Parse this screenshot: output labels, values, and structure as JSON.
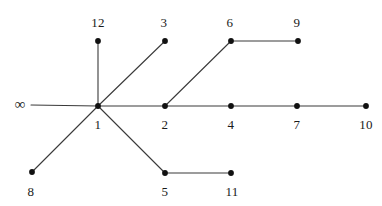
{
  "figure": {
    "type": "graph-diagram",
    "background_color": "#ffffff",
    "edge_color": "#3a3a3a",
    "node_color": "#111111",
    "label_color": "#1a1a1a",
    "width": 382,
    "height": 206
  },
  "infinity": {
    "symbol": "∞",
    "x": 20,
    "y": 104
  },
  "nodes": [
    {
      "id": "1",
      "label": "1",
      "x": 98,
      "y": 106,
      "label_x": 98,
      "label_y": 124
    },
    {
      "id": "2",
      "label": "2",
      "x": 165,
      "y": 106,
      "label_x": 165,
      "label_y": 124
    },
    {
      "id": "3",
      "label": "3",
      "x": 165,
      "y": 41,
      "label_x": 164,
      "label_y": 22
    },
    {
      "id": "4",
      "label": "4",
      "x": 231,
      "y": 106,
      "label_x": 231,
      "label_y": 124
    },
    {
      "id": "5",
      "label": "5",
      "x": 165,
      "y": 173,
      "label_x": 165,
      "label_y": 191
    },
    {
      "id": "6",
      "label": "6",
      "x": 231,
      "y": 41,
      "label_x": 230,
      "label_y": 22
    },
    {
      "id": "7",
      "label": "7",
      "x": 297,
      "y": 106,
      "label_x": 297,
      "label_y": 124
    },
    {
      "id": "8",
      "label": "8",
      "x": 32,
      "y": 172,
      "label_x": 31,
      "label_y": 191
    },
    {
      "id": "9",
      "label": "9",
      "x": 298,
      "y": 41,
      "label_x": 297,
      "label_y": 22
    },
    {
      "id": "10",
      "label": "10",
      "x": 366,
      "y": 106,
      "label_x": 366,
      "label_y": 124
    },
    {
      "id": "11",
      "label": "11",
      "x": 231,
      "y": 173,
      "label_x": 232,
      "label_y": 191
    },
    {
      "id": "12",
      "label": "12",
      "x": 98,
      "y": 41,
      "label_x": 98,
      "label_y": 22
    }
  ],
  "edges": [
    {
      "from": "infinity",
      "to": "1",
      "x1": 31,
      "y1": 105,
      "x2": 98,
      "y2": 106
    },
    {
      "from": "1",
      "to": "12",
      "x1": 98,
      "y1": 106,
      "x2": 98,
      "y2": 41
    },
    {
      "from": "1",
      "to": "3",
      "x1": 98,
      "y1": 106,
      "x2": 165,
      "y2": 41
    },
    {
      "from": "1",
      "to": "2",
      "x1": 98,
      "y1": 106,
      "x2": 165,
      "y2": 106
    },
    {
      "from": "1",
      "to": "5",
      "x1": 98,
      "y1": 106,
      "x2": 165,
      "y2": 173
    },
    {
      "from": "1",
      "to": "8",
      "x1": 98,
      "y1": 106,
      "x2": 32,
      "y2": 172
    },
    {
      "from": "2",
      "to": "6",
      "x1": 165,
      "y1": 106,
      "x2": 231,
      "y2": 41
    },
    {
      "from": "2",
      "to": "4",
      "x1": 165,
      "y1": 106,
      "x2": 231,
      "y2": 106
    },
    {
      "from": "4",
      "to": "7",
      "x1": 231,
      "y1": 106,
      "x2": 297,
      "y2": 106
    },
    {
      "from": "7",
      "to": "10",
      "x1": 297,
      "y1": 106,
      "x2": 366,
      "y2": 106
    },
    {
      "from": "6",
      "to": "9",
      "x1": 231,
      "y1": 41,
      "x2": 298,
      "y2": 41
    },
    {
      "from": "5",
      "to": "11",
      "x1": 165,
      "y1": 173,
      "x2": 231,
      "y2": 173
    }
  ]
}
